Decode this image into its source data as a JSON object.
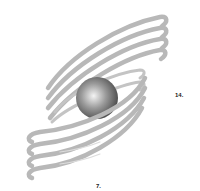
{
  "figure": {
    "colors": {
      "background": "#ffffff",
      "rings": "#b8b8b8",
      "ring_highlight": "#d0d0d0",
      "sphere_light": "#f4f4f4",
      "sphere_mid": "#9a9a9a",
      "sphere_dark": "#3e3e3e",
      "label": "#222222"
    },
    "ring_count_upper": 4,
    "ring_count_lower": 4
  },
  "labels": {
    "right": "14.",
    "bottom": "7."
  }
}
